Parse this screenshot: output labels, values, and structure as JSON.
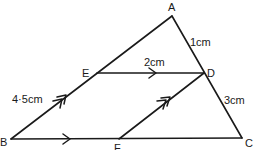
{
  "diagram": {
    "type": "geometry-triangle",
    "points": {
      "A": {
        "label": "A",
        "x": 172,
        "y": 16
      },
      "B": {
        "label": "B",
        "x": 11,
        "y": 139
      },
      "C": {
        "label": "C",
        "x": 242,
        "y": 138
      },
      "D": {
        "label": "D",
        "x": 204,
        "y": 73
      },
      "E": {
        "label": "E",
        "x": 97,
        "y": 73
      },
      "F": {
        "label": "F",
        "x": 119,
        "y": 139
      }
    },
    "segments": [
      {
        "from": "A",
        "to": "B"
      },
      {
        "from": "A",
        "to": "C"
      },
      {
        "from": "B",
        "to": "C",
        "parallel_marks": 1
      },
      {
        "from": "E",
        "to": "D",
        "parallel_marks": 1
      },
      {
        "from": "F",
        "to": "D",
        "parallel_marks": 2
      },
      {
        "from": "B",
        "to": "E",
        "parallel_marks": 2
      }
    ],
    "measurements": {
      "AD": "1cm",
      "ED": "2cm",
      "BE": "4·5cm",
      "DC": "3cm"
    }
  }
}
